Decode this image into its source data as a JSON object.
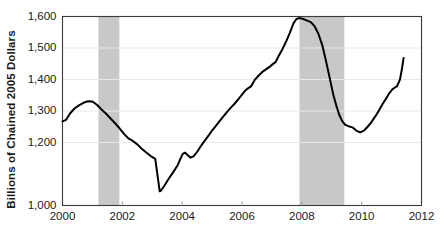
{
  "chart_data": {
    "type": "line",
    "title": "",
    "subtitle": "",
    "xlabel": "",
    "ylabel": "Billions of Chained 2005 Dollars",
    "xlim": [
      2000,
      2012
    ],
    "ylim": [
      1000,
      1600
    ],
    "grid": true,
    "legend": null,
    "legend_position": "none",
    "background_color": "#ffffff",
    "line_color": "#000000",
    "line_width": 2,
    "grid_color": "#e8e8e8",
    "axis_color": "#3a3a3a",
    "shade_color": "#c8c8c8",
    "y_ticks": [
      1000,
      1200,
      1300,
      1400,
      1500,
      1600
    ],
    "y_tick_labels": [
      "1,000",
      "1,200",
      "1,300",
      "1,400",
      "1,500",
      "1,600"
    ],
    "x_ticks": [
      2000,
      2002,
      2004,
      2006,
      2008,
      2010,
      2012
    ],
    "x_tick_labels": [
      "2000",
      "2002",
      "2004",
      "2006",
      "2008",
      "2010",
      "2012"
    ],
    "shaded_regions": [
      {
        "name": "recession-2001",
        "start": 2001.2,
        "end": 2001.9
      },
      {
        "name": "recession-2008",
        "start": 2007.92,
        "end": 2009.42
      }
    ],
    "series": [
      {
        "name": "real-business-investment",
        "color": "#000000",
        "points": [
          [
            2000.0,
            1267
          ],
          [
            2000.12,
            1272
          ],
          [
            2000.25,
            1292
          ],
          [
            2000.4,
            1308
          ],
          [
            2000.55,
            1318
          ],
          [
            2000.7,
            1326
          ],
          [
            2000.85,
            1331
          ],
          [
            2001.0,
            1330
          ],
          [
            2001.15,
            1320
          ],
          [
            2001.3,
            1305
          ],
          [
            2001.45,
            1292
          ],
          [
            2001.6,
            1277
          ],
          [
            2001.75,
            1262
          ],
          [
            2001.9,
            1246
          ],
          [
            2002.05,
            1228
          ],
          [
            2002.2,
            1213
          ],
          [
            2002.35,
            1205
          ],
          [
            2002.5,
            1194
          ],
          [
            2002.65,
            1180
          ],
          [
            2002.8,
            1168
          ],
          [
            2002.95,
            1157
          ],
          [
            2003.1,
            1148
          ],
          [
            2003.25,
            1045
          ],
          [
            2003.28,
            1046
          ],
          [
            2003.4,
            1062
          ],
          [
            2003.55,
            1085
          ],
          [
            2003.7,
            1106
          ],
          [
            2003.85,
            1128
          ],
          [
            2003.95,
            1150
          ],
          [
            2004.02,
            1164
          ],
          [
            2004.1,
            1168
          ],
          [
            2004.18,
            1160
          ],
          [
            2004.28,
            1152
          ],
          [
            2004.38,
            1156
          ],
          [
            2004.5,
            1170
          ],
          [
            2004.62,
            1188
          ],
          [
            2004.75,
            1205
          ],
          [
            2004.88,
            1222
          ],
          [
            2005.0,
            1238
          ],
          [
            2005.12,
            1252
          ],
          [
            2005.25,
            1268
          ],
          [
            2005.38,
            1283
          ],
          [
            2005.5,
            1297
          ],
          [
            2005.62,
            1310
          ],
          [
            2005.75,
            1323
          ],
          [
            2005.88,
            1338
          ],
          [
            2006.0,
            1352
          ],
          [
            2006.1,
            1364
          ],
          [
            2006.2,
            1372
          ],
          [
            2006.3,
            1378
          ],
          [
            2006.42,
            1398
          ],
          [
            2006.55,
            1412
          ],
          [
            2006.68,
            1424
          ],
          [
            2006.8,
            1432
          ],
          [
            2006.92,
            1440
          ],
          [
            2007.02,
            1448
          ],
          [
            2007.12,
            1455
          ],
          [
            2007.22,
            1474
          ],
          [
            2007.35,
            1496
          ],
          [
            2007.48,
            1522
          ],
          [
            2007.6,
            1548
          ],
          [
            2007.72,
            1578
          ],
          [
            2007.82,
            1592
          ],
          [
            2007.92,
            1595
          ],
          [
            2008.05,
            1592
          ],
          [
            2008.18,
            1587
          ],
          [
            2008.3,
            1582
          ],
          [
            2008.42,
            1570
          ],
          [
            2008.55,
            1546
          ],
          [
            2008.68,
            1510
          ],
          [
            2008.8,
            1462
          ],
          [
            2008.92,
            1410
          ],
          [
            2009.05,
            1352
          ],
          [
            2009.15,
            1318
          ],
          [
            2009.25,
            1288
          ],
          [
            2009.35,
            1268
          ],
          [
            2009.45,
            1256
          ],
          [
            2009.58,
            1251
          ],
          [
            2009.7,
            1248
          ],
          [
            2009.82,
            1238
          ],
          [
            2009.95,
            1232
          ],
          [
            2010.08,
            1238
          ],
          [
            2010.2,
            1250
          ],
          [
            2010.32,
            1264
          ],
          [
            2010.45,
            1282
          ],
          [
            2010.58,
            1302
          ],
          [
            2010.7,
            1322
          ],
          [
            2010.82,
            1340
          ],
          [
            2010.92,
            1356
          ],
          [
            2011.02,
            1368
          ],
          [
            2011.1,
            1374
          ],
          [
            2011.18,
            1378
          ],
          [
            2011.28,
            1400
          ],
          [
            2011.34,
            1430
          ],
          [
            2011.4,
            1468
          ]
        ]
      }
    ]
  }
}
